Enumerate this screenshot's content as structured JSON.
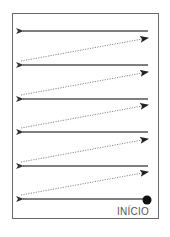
{
  "diagram": {
    "type": "reading-path",
    "start_label": "INÍCIO",
    "colors": {
      "frame": "#6a6a6a",
      "solid_arrow": "#555555",
      "dotted_arrow": "#888888",
      "start_dot": "#111111"
    },
    "solid_rows_y": [
      31,
      65,
      99,
      132,
      166,
      199
    ],
    "dotted_rows": [
      {
        "from": [
          21,
          61
        ],
        "to": [
          148,
          38
        ]
      },
      {
        "from": [
          21,
          95
        ],
        "to": [
          148,
          72
        ]
      },
      {
        "from": [
          21,
          128
        ],
        "to": [
          148,
          105
        ]
      },
      {
        "from": [
          21,
          162
        ],
        "to": [
          148,
          139
        ]
      },
      {
        "from": [
          21,
          195
        ],
        "to": [
          148,
          172
        ]
      }
    ],
    "start_point": [
      147,
      200
    ]
  }
}
